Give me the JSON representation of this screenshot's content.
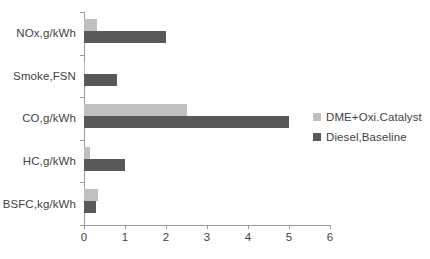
{
  "chart_data": {
    "type": "bar",
    "orientation": "horizontal",
    "title": "",
    "xlabel": "",
    "ylabel": "",
    "categories": [
      "NOx,g/kWh",
      "Smoke,FSN",
      "CO,g/kWh",
      "HC,g/kWh",
      "BSFC,kg/kWh"
    ],
    "series": [
      {
        "name": "DME+Oxi.Catalyst",
        "color": "#BFBFBF",
        "values": [
          0.32,
          0.02,
          2.5,
          0.15,
          0.35
        ]
      },
      {
        "name": "Diesel,Baseline",
        "color": "#595959",
        "values": [
          2.0,
          0.8,
          5.0,
          1.0,
          0.3
        ]
      }
    ],
    "xlim": [
      0,
      6
    ],
    "xticks": [
      0,
      1,
      2,
      3,
      4,
      5,
      6
    ],
    "xtick_labels": [
      "0",
      "1",
      "2",
      "3",
      "4",
      "5",
      "6"
    ],
    "grid": false,
    "legend_position": "right",
    "axis_color": "#9a9a9a",
    "background": "#ffffff"
  },
  "legend": {
    "items": [
      {
        "label": "DME+Oxi.Catalyst",
        "color": "#BFBFBF"
      },
      {
        "label": "Diesel,Baseline",
        "color": "#595959"
      }
    ]
  }
}
